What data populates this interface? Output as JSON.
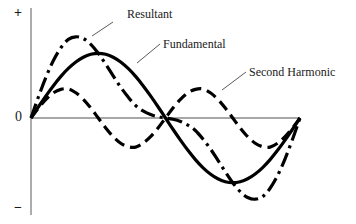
{
  "figure": {
    "name": "waveform-harmonics-figure",
    "background_color": "#ffffff",
    "width": 356,
    "height": 224
  },
  "axes": {
    "positive_label": "+",
    "zero_label": "0",
    "negative_label": "−",
    "axis_color": "#8a8a8a",
    "x_axis": {
      "y_px": 118,
      "x_start_px": 31,
      "x_end_px": 300
    },
    "y_axis": {
      "x_px": 31,
      "y_start_px": 8,
      "y_end_px": 215
    }
  },
  "annotations": [
    {
      "id": "resultant",
      "label": "Resultant",
      "leader_from": [
        113,
        22
      ],
      "leader_to": [
        92,
        36
      ]
    },
    {
      "id": "fundamental",
      "label": "Fundamental",
      "leader_from": [
        160,
        44
      ],
      "leader_to": [
        137,
        63
      ]
    },
    {
      "id": "second-harmonic",
      "label": "Second Harmonic",
      "leader_from": [
        246,
        72
      ],
      "leader_to": [
        222,
        90
      ]
    }
  ],
  "chart_data": {
    "type": "line",
    "title": "",
    "subtitle": "",
    "xlabel": "",
    "ylabel": "",
    "grid": false,
    "legend_position": "inline-annotations",
    "xlim": [
      0,
      360
    ],
    "ylim": [
      -1.5,
      1.5
    ],
    "y_tick_labels": [
      "+",
      "0",
      "−"
    ],
    "x_unit": "degrees",
    "x": [
      0,
      10,
      20,
      30,
      40,
      50,
      60,
      70,
      80,
      90,
      100,
      110,
      120,
      130,
      140,
      150,
      160,
      170,
      180,
      190,
      200,
      210,
      220,
      230,
      240,
      250,
      260,
      270,
      280,
      290,
      300,
      310,
      320,
      330,
      340,
      350,
      360
    ],
    "series": [
      {
        "name": "Fundamental",
        "line_style": "solid",
        "color": "#000000",
        "line_width": 3.2,
        "amplitude": 1.0,
        "cycles": 1,
        "phase_deg": 0,
        "values": [
          0.0,
          0.174,
          0.342,
          0.5,
          0.643,
          0.766,
          0.866,
          0.94,
          0.985,
          1.0,
          0.985,
          0.94,
          0.866,
          0.766,
          0.643,
          0.5,
          0.342,
          0.174,
          0.0,
          -0.174,
          -0.342,
          -0.5,
          -0.643,
          -0.766,
          -0.866,
          -0.94,
          -0.985,
          -1.0,
          -0.985,
          -0.94,
          -0.866,
          -0.766,
          -0.643,
          -0.5,
          -0.342,
          -0.174,
          0.0
        ]
      },
      {
        "name": "Second Harmonic",
        "line_style": "dashed",
        "color": "#000000",
        "line_width": 3.2,
        "amplitude": 0.45,
        "cycles": 2,
        "phase_deg": 0,
        "values": [
          0.0,
          0.154,
          0.289,
          0.39,
          0.443,
          0.45,
          0.39,
          0.289,
          0.154,
          0.0,
          -0.154,
          -0.289,
          -0.39,
          -0.443,
          -0.45,
          -0.39,
          -0.289,
          -0.154,
          0.0,
          0.154,
          0.289,
          0.39,
          0.443,
          0.45,
          0.39,
          0.289,
          0.154,
          0.0,
          -0.154,
          -0.289,
          -0.39,
          -0.443,
          -0.45,
          -0.39,
          -0.289,
          -0.154,
          0.0
        ]
      },
      {
        "name": "Resultant",
        "line_style": "dash-dot",
        "color": "#000000",
        "line_width": 3.2,
        "description": "sum of fundamental and second harmonic",
        "values": [
          0.0,
          0.328,
          0.631,
          0.89,
          1.086,
          1.216,
          1.256,
          1.229,
          1.139,
          1.0,
          0.831,
          0.651,
          0.476,
          0.323,
          0.193,
          0.11,
          0.053,
          0.02,
          0.0,
          -0.02,
          -0.053,
          -0.11,
          -0.193,
          -0.323,
          -0.476,
          -0.651,
          -0.831,
          -1.0,
          -1.139,
          -1.229,
          -1.256,
          -1.216,
          -1.086,
          -0.89,
          -0.631,
          -0.328,
          0.0
        ]
      }
    ]
  }
}
